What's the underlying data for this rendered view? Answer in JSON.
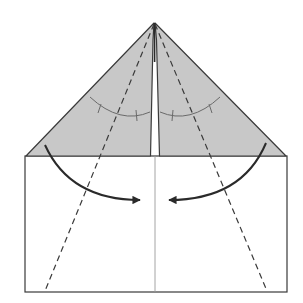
{
  "diagram": {
    "type": "origami-fold-step",
    "colors": {
      "background": "#ffffff",
      "paper_front": "#ffffff",
      "paper_colored": "#c8c8c8",
      "line": "#3a3a3a",
      "center_crease": "#9a9a9a",
      "angle_mark": "#6a6a6a"
    },
    "elements": {
      "rectangle_body": "lower white paper body",
      "left_flap": "shaded left triangular flap",
      "right_flap": "shaded right triangular flap",
      "center_crease": "vertical center crease line",
      "valley_fold_left": "dashed left valley fold line",
      "valley_fold_right": "dashed right valley fold line",
      "angle_bisect_marks": "equal-angle arc marks",
      "fold_arrow_left": "curved arrow folding left side to center",
      "fold_arrow_right": "curved arrow folding right side to center"
    }
  }
}
